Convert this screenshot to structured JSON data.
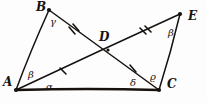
{
  "figure": {
    "background_color": "#fdfdfd",
    "ink_color": "#15120f"
  },
  "points": [
    {
      "id": "A",
      "label": "A",
      "x": 16,
      "y": 90,
      "label_x": 3,
      "label_y": 76
    },
    {
      "id": "B",
      "label": "B",
      "x": 49,
      "y": 10,
      "label_x": 36,
      "label_y": 1
    },
    {
      "id": "C",
      "label": "C",
      "x": 159,
      "y": 90,
      "label_x": 167,
      "label_y": 78
    },
    {
      "id": "D",
      "label": "D",
      "x": 108,
      "y": 50,
      "label_x": 99,
      "label_y": 31
    },
    {
      "id": "E",
      "label": "E",
      "x": 180,
      "y": 14,
      "label_x": 188,
      "label_y": 10
    }
  ],
  "segments": [
    {
      "id": "AB",
      "from": "A",
      "to": "B",
      "style": "thin",
      "ticks": 0
    },
    {
      "id": "BC",
      "from": "B",
      "to": "C",
      "style": "thin",
      "ticks": 0
    },
    {
      "id": "AE",
      "from": "A",
      "to": "E",
      "style": "thin",
      "ticks": 0
    },
    {
      "id": "CE",
      "from": "C",
      "to": "E",
      "style": "thin",
      "ticks": 0
    },
    {
      "id": "AC",
      "from": "A",
      "to": "C",
      "style": "base",
      "ticks": 0
    }
  ],
  "tick_marks": [
    {
      "id": "tick-BD",
      "segment": "BD",
      "count": 2,
      "x": 73,
      "y": 32,
      "angle": 68
    },
    {
      "id": "tick-DC",
      "segment": "DC",
      "count": 1,
      "x": 133,
      "y": 70,
      "angle": 68
    },
    {
      "id": "tick-AD",
      "segment": "AD",
      "count": 1,
      "x": 63,
      "y": 72,
      "angle": -17
    },
    {
      "id": "tick-DE",
      "segment": "DE",
      "count": 2,
      "x": 144,
      "y": 32,
      "angle": -17
    }
  ],
  "angles": [
    {
      "id": "angle-beta-A",
      "label": "β",
      "vertex": "A",
      "x": 28,
      "y": 70
    },
    {
      "id": "angle-alpha-A",
      "label": "α",
      "vertex": "A",
      "x": 46,
      "y": 82
    },
    {
      "id": "angle-gamma-B",
      "label": "γ",
      "vertex": "B",
      "x": 50,
      "y": 17
    },
    {
      "id": "angle-delta-C",
      "label": "δ",
      "vertex": "C",
      "x": 130,
      "y": 78
    },
    {
      "id": "angle-theta-C",
      "label": "ϱ",
      "vertex": "C",
      "x": 150,
      "y": 72
    },
    {
      "id": "angle-beta-E",
      "label": "β",
      "vertex": "E",
      "x": 168,
      "y": 28
    }
  ]
}
